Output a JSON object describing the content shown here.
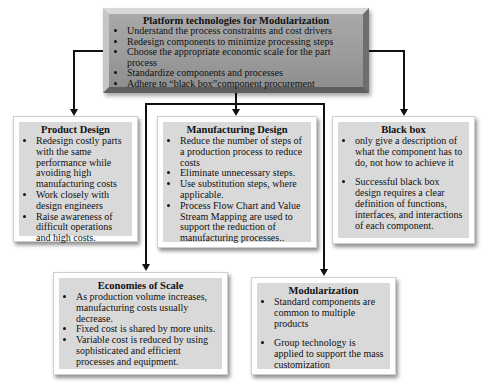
{
  "diagram": {
    "top": {
      "title": "Platform technologies for Modularization",
      "items": [
        "Understand the process constraints and cost drivers",
        "Redesign components to minimize processing steps",
        "Choose the appropriate economic scale for the part process",
        "Standardize components and processes",
        "Adhere to “black box”component procurement"
      ]
    },
    "product_design": {
      "title": "Product Design",
      "items": [
        "Redesign costly parts with the same performance while avoiding high manufacturing costs",
        "Work closely with design engineers",
        "Raise awareness of difficult operations and high costs."
      ]
    },
    "manufacturing_design": {
      "title": "Manufacturing Design",
      "items": [
        "Reduce the number of steps of a production process to reduce costs",
        "Eliminate unnecessary steps.",
        "Use substitution steps, where applicable.",
        "Process Flow Chart and Value Stream Mapping are used to support the reduction of manufacturing processes.."
      ]
    },
    "black_box": {
      "title": "Black box",
      "items": [
        "only give a description of what the component has to do, not how to achieve it",
        "Successful black box design requires a clear definition of functions, interfaces, and interactions of each component."
      ]
    },
    "economies_of_scale": {
      "title": "Economies of Scale",
      "items": [
        "As production volume increases, manufacturing costs usually decrease.",
        "Fixed cost is shared by more units.",
        "Variable cost is reduced by using sophisticated and efficient processes and equipment."
      ]
    },
    "modularization": {
      "title": "Modularization",
      "items": [
        "Standard components are common to multiple products",
        "Group technology  is applied to support the mass customization"
      ]
    }
  }
}
